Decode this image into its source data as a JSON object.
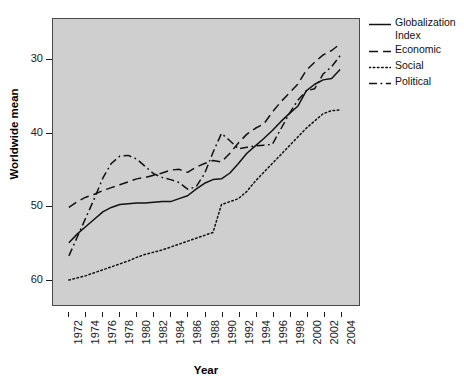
{
  "chart_data": {
    "type": "line",
    "title": "",
    "xlabel": "Year",
    "ylabel": "Worldwide mean",
    "xlim": [
      1972,
      2004
    ],
    "ylim": [
      26.5,
      65.5
    ],
    "yticks": [
      30,
      40,
      50,
      60
    ],
    "grid": false,
    "legend_position": "right",
    "panel_background": "#cfcfcf",
    "x": [
      1972,
      1973,
      1974,
      1975,
      1976,
      1977,
      1978,
      1979,
      1980,
      1981,
      1982,
      1983,
      1984,
      1985,
      1986,
      1987,
      1988,
      1989,
      1990,
      1991,
      1992,
      1993,
      1994,
      1995,
      1996,
      1997,
      1998,
      1999,
      2000,
      2001,
      2002,
      2003,
      2004
    ],
    "xticks": [
      1972,
      1974,
      1976,
      1978,
      1980,
      1982,
      1984,
      1986,
      1988,
      1990,
      1992,
      1994,
      1996,
      1998,
      2000,
      2002,
      2004
    ],
    "series": [
      {
        "name": "Globalization Index",
        "style": "solid",
        "color": "#111111",
        "values": [
          35.0,
          36.2,
          37.2,
          38.2,
          39.2,
          39.8,
          40.2,
          40.3,
          40.4,
          40.4,
          40.5,
          40.6,
          40.6,
          41.0,
          41.4,
          42.3,
          43.1,
          43.6,
          43.7,
          44.5,
          45.8,
          47.2,
          48.2,
          49.2,
          50.3,
          51.5,
          52.6,
          53.6,
          55.7,
          56.6,
          57.2,
          57.4,
          58.6
        ]
      },
      {
        "name": "Economic",
        "style": "dashed",
        "color": "#111111",
        "values": [
          39.8,
          40.6,
          41.2,
          41.6,
          42.1,
          42.5,
          42.9,
          43.3,
          43.7,
          43.9,
          44.2,
          44.5,
          44.9,
          45.0,
          44.6,
          45.3,
          45.8,
          46.2,
          46.0,
          47.2,
          48.6,
          49.8,
          50.6,
          51.2,
          52.8,
          54.2,
          55.4,
          56.6,
          58.5,
          59.6,
          60.6,
          61.2,
          62.1
        ]
      },
      {
        "name": "Social",
        "style": "dotted",
        "color": "#111111",
        "values": [
          29.9,
          30.2,
          30.5,
          30.9,
          31.3,
          31.7,
          32.1,
          32.5,
          33.0,
          33.4,
          33.7,
          34.0,
          34.4,
          34.8,
          35.2,
          35.6,
          36.0,
          36.4,
          40.2,
          40.6,
          41.0,
          42.0,
          43.4,
          44.6,
          45.8,
          47.0,
          48.2,
          49.4,
          50.6,
          51.6,
          52.6,
          53.0,
          53.1
        ]
      },
      {
        "name": "Political",
        "style": "dashdot",
        "color": "#111111",
        "values": [
          33.2,
          35.8,
          38.4,
          41.0,
          43.8,
          45.8,
          46.8,
          46.9,
          46.4,
          45.4,
          44.4,
          43.9,
          43.6,
          43.2,
          42.3,
          42.6,
          44.4,
          47.3,
          49.9,
          48.9,
          47.8,
          48.0,
          48.2,
          48.3,
          48.4,
          50.5,
          52.6,
          54.4,
          55.7,
          56.0,
          58.0,
          59.0,
          60.5
        ]
      }
    ]
  },
  "axes": {
    "y_title": "Worldwide mean",
    "x_title": "Year",
    "y_tick_labels": [
      "60",
      "50",
      "40",
      "30"
    ],
    "x_tick_labels": [
      "1972",
      "1974",
      "1976",
      "1978",
      "1980",
      "1982",
      "1984",
      "1986",
      "1988",
      "1990",
      "1992",
      "1994",
      "1996",
      "1998",
      "2000",
      "2002",
      "2004"
    ]
  },
  "legend": {
    "items": [
      {
        "label": "Globalization\nIndex",
        "style": "solid"
      },
      {
        "label": "Economic",
        "style": "dashed"
      },
      {
        "label": "Social",
        "style": "dotted"
      },
      {
        "label": "Political",
        "style": "dashdot"
      }
    ]
  }
}
